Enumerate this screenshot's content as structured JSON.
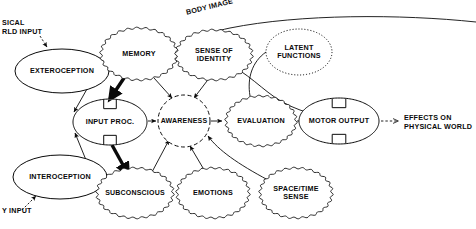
{
  "diagram": {
    "colors": {
      "ink": "#0a0a0a",
      "background": "#ffffff"
    },
    "nodes": [
      {
        "id": "exteroception",
        "label": "EXTEROCEPTION",
        "border": "solid",
        "shape": "ellipse",
        "cx": 62,
        "cy": 71,
        "rx": 47,
        "ry": 22,
        "font_size": 7.2
      },
      {
        "id": "interoception",
        "label": "INTEROCEPTION",
        "border": "solid",
        "shape": "ellipse",
        "cx": 60,
        "cy": 177,
        "rx": 47,
        "ry": 22,
        "font_size": 7.2
      },
      {
        "id": "memory",
        "label": "MEMORY",
        "border": "scalloped",
        "shape": "ellipse",
        "cx": 139,
        "cy": 54,
        "rx": 38,
        "ry": 26,
        "font_size": 7.2
      },
      {
        "id": "sense-of-identity",
        "label": "SENSE OF\nIDENTITY",
        "border": "scalloped",
        "shape": "ellipse",
        "cx": 214,
        "cy": 55,
        "rx": 38,
        "ry": 25,
        "font_size": 7.2
      },
      {
        "id": "latent-functions",
        "label": "LATENT\nFUNCTIONS",
        "border": "dotted",
        "shape": "ellipse",
        "cx": 299,
        "cy": 52,
        "rx": 33,
        "ry": 23,
        "font_size": 7.2
      },
      {
        "id": "input-proc",
        "label": "INPUT PROC.",
        "border": "solid-notched",
        "shape": "ellipse",
        "cx": 110,
        "cy": 122,
        "rx": 37,
        "ry": 23,
        "font_size": 7.2
      },
      {
        "id": "awareness",
        "label": "AWARENESS",
        "border": "dashed",
        "shape": "circle",
        "cx": 184,
        "cy": 121,
        "rx": 26,
        "ry": 26,
        "font_size": 7.0
      },
      {
        "id": "evaluation",
        "label": "EVALUATION",
        "border": "scalloped",
        "shape": "ellipse",
        "cx": 261,
        "cy": 121,
        "rx": 35,
        "ry": 25,
        "font_size": 7.2
      },
      {
        "id": "motor-output",
        "label": "MOTOR OUTPUT",
        "border": "solid-notched",
        "shape": "ellipse",
        "cx": 339,
        "cy": 121,
        "rx": 40,
        "ry": 23,
        "font_size": 7.2
      },
      {
        "id": "subconscious",
        "label": "SUBCONSCIOUS",
        "border": "scalloped",
        "shape": "ellipse",
        "cx": 135,
        "cy": 193,
        "rx": 38,
        "ry": 25,
        "font_size": 7.0
      },
      {
        "id": "emotions",
        "label": "EMOTIONS",
        "border": "scalloped",
        "shape": "ellipse",
        "cx": 213,
        "cy": 193,
        "rx": 36,
        "ry": 25,
        "font_size": 7.2
      },
      {
        "id": "space-time-sense",
        "label": "SPACE/TIME\nSENSE",
        "border": "scalloped",
        "shape": "ellipse",
        "cx": 296,
        "cy": 193,
        "rx": 36,
        "ry": 25,
        "font_size": 7.2
      }
    ],
    "free_labels": [
      {
        "id": "physical-world-input",
        "text": "SICAL\nRLD INPUT",
        "x": 2,
        "y": 18,
        "font_size": 7.2,
        "align": "left"
      },
      {
        "id": "body-input",
        "text": "Y INPUT",
        "x": 2,
        "y": 206,
        "font_size": 7.2,
        "align": "left"
      },
      {
        "id": "body-image",
        "text": "BODY IMAGE",
        "x": 185,
        "y": 8,
        "font_size": 7.2,
        "align": "left",
        "rotate": -14
      },
      {
        "id": "effects-on-physical-world",
        "text": "EFFECTS ON\nPHYSICAL WORLD",
        "x": 404,
        "y": 113,
        "font_size": 7.2,
        "align": "left"
      }
    ],
    "connections": [
      {
        "id": "world-input-to-exteroception",
        "style": "thin-dashed-arrow"
      },
      {
        "id": "body-input-to-interoception",
        "style": "thin-dashed-arrow"
      },
      {
        "id": "exteroception-to-input-proc",
        "style": "thin-arrow"
      },
      {
        "id": "interoception-to-input-proc",
        "style": "thin-arrow"
      },
      {
        "id": "memory-to-input-proc",
        "style": "thick-arrow"
      },
      {
        "id": "input-proc-to-subconscious",
        "style": "thick-arrow"
      },
      {
        "id": "input-proc-to-awareness",
        "style": "thin-arrow"
      },
      {
        "id": "memory-to-awareness",
        "style": "thin-arrow"
      },
      {
        "id": "sense-of-identity-to-awareness",
        "style": "thin-arrow"
      },
      {
        "id": "subconscious-to-awareness",
        "style": "thin-arrow"
      },
      {
        "id": "emotions-to-awareness",
        "style": "thin-arrow"
      },
      {
        "id": "space-time-sense-to-awareness",
        "style": "thin-arrow"
      },
      {
        "id": "awareness-to-evaluation",
        "style": "thin-arrow"
      },
      {
        "id": "evaluation-to-motor-output",
        "style": "thin-arrow"
      },
      {
        "id": "sense-of-identity-to-motor-output",
        "style": "thin-curve"
      },
      {
        "id": "motor-output-to-effects",
        "style": "thin-dashed-arrow"
      },
      {
        "id": "body-image-arc-to-memory",
        "style": "thin-curve-arrow"
      }
    ]
  }
}
